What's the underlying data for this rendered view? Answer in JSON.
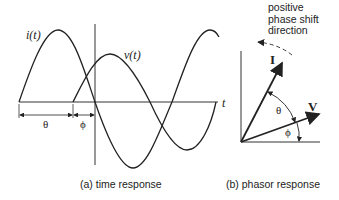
{
  "time_response": {
    "current_label": "i(t)",
    "voltage_label": "v(t)",
    "time_axis_label": "t",
    "theta_label": "θ",
    "phi_label": "ϕ",
    "caption": "(a) time response"
  },
  "phasor_response": {
    "current_label": "I",
    "voltage_label": "V",
    "theta_label": "θ",
    "phi_label": "ϕ",
    "note": [
      "positive",
      "phase shift",
      "direction"
    ],
    "caption": "(b) phasor response"
  }
}
